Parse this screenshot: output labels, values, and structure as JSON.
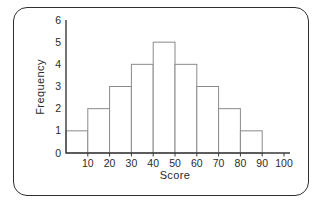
{
  "figure": {
    "type": "textbook-histogram-figure"
  },
  "chart_data": {
    "type": "bar",
    "subtype": "histogram",
    "title": "",
    "xlabel": "Score",
    "ylabel": "Frequency",
    "bin_edges": [
      0,
      10,
      20,
      30,
      40,
      50,
      60,
      70,
      80,
      90
    ],
    "frequencies": [
      1,
      2,
      3,
      4,
      5,
      4,
      3,
      2,
      1
    ],
    "x_ticks": [
      10,
      20,
      30,
      40,
      50,
      60,
      70,
      80,
      90,
      100
    ],
    "y_ticks": [
      0,
      1,
      2,
      3,
      4,
      5,
      6
    ],
    "xlim": [
      0,
      100
    ],
    "ylim": [
      0,
      6
    ],
    "grid": false,
    "legend": null,
    "colors": {
      "bar_fill": "#ffffff",
      "bar_stroke": "#8a8a8a",
      "axis": "#3a3a3a",
      "tick_text": "#2a2a2a",
      "frame_border": "#2e2e2e",
      "background": "#ffffff"
    }
  }
}
